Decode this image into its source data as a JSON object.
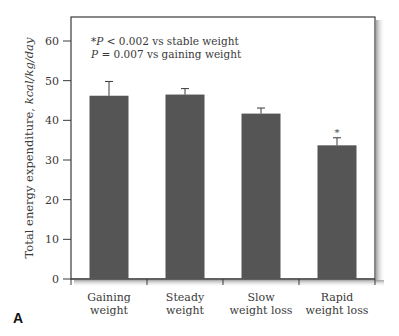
{
  "panel_label": "A",
  "annotation": {
    "line1_prefix": "*",
    "line1_p": "P",
    "line1_rest": " < 0.002 vs stable weight",
    "line2_p": "P",
    "line2_rest": " = 0.007 vs gaining weight"
  },
  "y_axis": {
    "label_main": "Total energy expenditure, ",
    "label_unit": "kcal/kg/day",
    "ticks": [
      "0",
      "10",
      "20",
      "30",
      "40",
      "50",
      "60"
    ]
  },
  "categories": [
    {
      "line1": "Gaining",
      "line2": "weight"
    },
    {
      "line1": "Steady",
      "line2": "weight"
    },
    {
      "line1": "Slow",
      "line2": "weight loss"
    },
    {
      "line1": "Rapid",
      "line2": "weight loss"
    }
  ],
  "significance_marker": "*",
  "colors": {
    "bar": "#555555",
    "frame": "#3a3a3a",
    "shadow": "#bdbdbd"
  },
  "chart_data": {
    "type": "bar",
    "title": "",
    "categories": [
      "Gaining weight",
      "Steady weight",
      "Slow weight loss",
      "Rapid weight loss"
    ],
    "values": [
      46.2,
      46.5,
      41.7,
      33.7
    ],
    "error_upper": [
      49.8,
      48.0,
      43.1,
      35.6
    ],
    "errors": [
      3.6,
      1.5,
      1.4,
      1.9
    ],
    "significance": [
      false,
      false,
      false,
      true
    ],
    "xlabel": "",
    "ylabel": "Total energy expenditure, kcal/kg/day",
    "ylim": [
      0,
      60
    ],
    "yticks": [
      0,
      10,
      20,
      30,
      40,
      50,
      60
    ],
    "grid": false,
    "legend": null,
    "annotations": [
      "*P < 0.002 vs stable weight",
      "P = 0.007 vs gaining weight"
    ],
    "panel_label": "A"
  }
}
